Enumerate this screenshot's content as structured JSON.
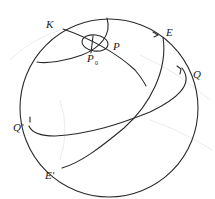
{
  "figure": {
    "type": "celestial-sphere-diagram",
    "labels": {
      "K": "K",
      "P": "P",
      "P0_main": "P",
      "P0_sub": "0",
      "E": "E",
      "Q": "Q",
      "Q_prime": "Q'",
      "E_prime": "E'"
    },
    "colors": {
      "stroke": "#2a2a2a",
      "background": "#ffffff",
      "faint_background_lines": "#e6e6e6"
    }
  }
}
